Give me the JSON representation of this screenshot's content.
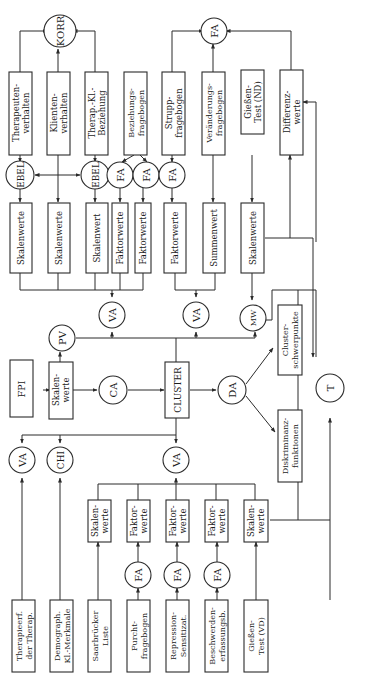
{
  "diagram": {
    "orientation": "rotated-90-ccw",
    "colors": {
      "line": "#2a2a2a",
      "background": "#ffffff",
      "text": "#1c1c1c"
    },
    "circles": {
      "korr": "KORR",
      "fa_top": "FA",
      "ebel_1": "EBEL",
      "ebel_2": "EBEL",
      "fa_bez_1": "FA",
      "fa_bez_2": "FA",
      "fa_strupp": "FA",
      "va_top_left": "VA",
      "va_top_right": "VA",
      "pv": "PV",
      "mw": "MW",
      "ca": "CA",
      "da": "DA",
      "t": "T",
      "va_bottom_1": "VA",
      "chi": "CHI",
      "va_bottom_center": "VA",
      "fa_furcht": "FA",
      "fa_repression": "FA",
      "fa_beschwerden": "FA"
    },
    "boxes": {
      "therapeutenverhalten": [
        "Therapeuten-",
        "verhalten"
      ],
      "klientenverhalten": [
        "Klienten-",
        "verhalten"
      ],
      "therap_kl_beziehung": [
        "Therap.-Kl.-",
        "Beziehung"
      ],
      "beziehungsfragebogen": [
        "Beziehungs-",
        "fragebogen"
      ],
      "struppfragebogen": [
        "Strupp-",
        "fragebogen"
      ],
      "veraenderungsfragebogen": [
        "Veränderungs-",
        "fragebogen"
      ],
      "giessen_nd": [
        "Gießen-",
        "Test (ND)"
      ],
      "differenzwerte": [
        "Differenz-",
        "werte"
      ],
      "skalenwerte_1": [
        "Skalenwerte"
      ],
      "skalenwerte_2": [
        "Skalenwerte"
      ],
      "skalenwert_3": [
        "Skalenwert"
      ],
      "faktorwerte_1": [
        "Faktorwerte"
      ],
      "faktorwerte_2": [
        "Faktorwerte"
      ],
      "faktorwerte_3": [
        "Faktorwerte"
      ],
      "summenwert": [
        "Summenwert"
      ],
      "skalenwerte_nd": [
        "Skalenwerte"
      ],
      "fpi": [
        "FPI"
      ],
      "skalenwerte_fpi": [
        "Skalen-",
        "werte"
      ],
      "cluster": [
        "CLUSTER"
      ],
      "clusterschwerpunkte": [
        "Cluster-",
        "schwerpunkte"
      ],
      "diskriminanzfunktionen": [
        "Diskriminanz-",
        "funktionen"
      ],
      "therapieerfahrung": [
        "Therapieerf.",
        "der Therap."
      ],
      "demograph": [
        "Demograph.",
        "Kl.-Merkmale"
      ],
      "saarbruecker": [
        "Saarbrücker",
        "Liste"
      ],
      "furcht": [
        "Furcht-",
        "fragebogen"
      ],
      "repression": [
        "Repression-",
        "Sensitizat."
      ],
      "beschwerden": [
        "Beschwerden-",
        "erfassungsb."
      ],
      "giessen_vd": [
        "Gießen-",
        "Test (VD)"
      ],
      "skalenwerte_saar": [
        "Skalen-",
        "werte"
      ],
      "faktorwerte_furcht": [
        "Faktor-",
        "werte"
      ],
      "faktorwerte_repr": [
        "Faktor-",
        "werte"
      ],
      "faktorwerte_beschw": [
        "Faktor-",
        "werte"
      ],
      "skalenwerte_vd": [
        "Skalen-",
        "werte"
      ]
    }
  }
}
